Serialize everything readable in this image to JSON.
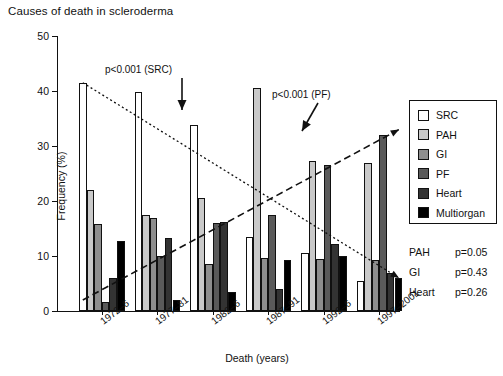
{
  "title": "Causes of death in scleroderma",
  "chart_data": {
    "type": "bar",
    "title": "Causes of death in scleroderma",
    "xlabel": "Death (years)",
    "ylabel": "Frequency (%)",
    "categories": [
      "1972–6",
      "1977–81",
      "1982–6",
      "1987–91",
      "1992–6",
      "1997–2001"
    ],
    "ylim": [
      0,
      50
    ],
    "yticks": [
      0,
      10,
      20,
      30,
      40,
      50
    ],
    "grid": false,
    "legend_position": "right",
    "series": [
      {
        "name": "SRC",
        "color": "#ffffff",
        "values": [
          41.5,
          39.8,
          33.8,
          13.5,
          10.5,
          5.5
        ]
      },
      {
        "name": "PAH",
        "color": "#c9c9c9",
        "values": [
          22.0,
          17.5,
          20.5,
          40.5,
          27.3,
          27.0
        ]
      },
      {
        "name": "GI",
        "color": "#8e8e8e",
        "values": [
          15.8,
          17.0,
          8.5,
          9.7,
          9.5,
          9.3
        ]
      },
      {
        "name": "PF",
        "color": "#5a5a5a",
        "values": [
          1.7,
          10.0,
          16.0,
          17.5,
          26.5,
          32.0
        ]
      },
      {
        "name": "Heart",
        "color": "#333333",
        "values": [
          6.0,
          13.2,
          16.2,
          4.0,
          12.2,
          7.0
        ]
      },
      {
        "name": "Multiorgan",
        "color": "#000000",
        "values": [
          12.7,
          2.0,
          3.5,
          9.3,
          10.0,
          6.0
        ]
      }
    ],
    "annotations": [
      {
        "text": "p<0.001 (SRC)",
        "target": "SRC trend"
      },
      {
        "text": "p<0.001 (PF)",
        "target": "PF trend"
      }
    ],
    "trend_lines": [
      {
        "name": "SRC",
        "style": "dotted",
        "from": [
          0,
          41.5
        ],
        "to": [
          5,
          6.0
        ]
      },
      {
        "name": "PF",
        "style": "dashed",
        "from": [
          0,
          2.0
        ],
        "to": [
          5,
          33.0
        ]
      }
    ]
  },
  "legend": {
    "items": [
      {
        "label": "SRC",
        "color": "#ffffff"
      },
      {
        "label": "PAH",
        "color": "#c9c9c9"
      },
      {
        "label": "GI",
        "color": "#8e8e8e"
      },
      {
        "label": "PF",
        "color": "#5a5a5a"
      },
      {
        "label": "Heart",
        "color": "#333333"
      },
      {
        "label": "Multiorgan",
        "color": "#000000"
      }
    ]
  },
  "pvalues": [
    {
      "name": "PAH",
      "value": "p=0.05"
    },
    {
      "name": "GI",
      "value": "p=0.43"
    },
    {
      "name": "Heart",
      "value": "p=0.26"
    }
  ],
  "annotations": {
    "src": "p<0.001 (SRC)",
    "pf": "p<0.001 (PF)"
  },
  "axes": {
    "y_ticklabels": [
      "0",
      "10",
      "20",
      "30",
      "40",
      "50"
    ],
    "ylabel": "Frequency (%)",
    "xlabel": "Death (years)"
  }
}
